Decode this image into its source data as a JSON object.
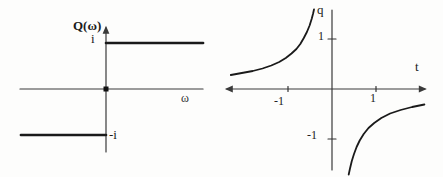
{
  "figure": {
    "background_color": "#fdfdfc",
    "line_color": "#1a1a1a",
    "axis_color": "#3a3a3a"
  },
  "chart_data": [
    {
      "id": "frequency-domain-step",
      "type": "line",
      "title": "",
      "xlabel": "ω",
      "ylabel": "Q(ω)",
      "xlim": [
        -1.87,
        2.11
      ],
      "ylim": [
        -1.37,
        1.33
      ],
      "grid": false,
      "legend": "none",
      "function": "Q(ω) = i for ω > 0, -i for ω < 0",
      "annotations": {
        "upper_level": "i",
        "lower_level": "-i"
      },
      "x_axis_arrows": "none",
      "y_axis_arrow": "top",
      "origin_marker": [
        0,
        0
      ],
      "x_ticks": [],
      "y_ticks": [],
      "series": [
        {
          "name": "upper-step",
          "points": [
            [
              0,
              1
            ],
            [
              2.11,
              1
            ]
          ]
        },
        {
          "name": "lower-step",
          "points": [
            [
              -1.85,
              -1
            ],
            [
              0,
              -1
            ]
          ]
        }
      ]
    },
    {
      "id": "time-domain-kernel",
      "type": "line",
      "title": "",
      "xlabel": "t",
      "ylabel": "q",
      "xlim": [
        -2.39,
        2.11
      ],
      "ylim": [
        -1.62,
        1.58
      ],
      "grid": false,
      "legend": "none",
      "function": "q(t) ∝ -1/t (hyperbola branches, vertical asymptote at t = 0)",
      "x_axis_arrows": "both",
      "y_axis_arrow": "none",
      "x_ticks": [
        {
          "value": -1,
          "label": "-1"
        },
        {
          "value": 1,
          "label": "1"
        }
      ],
      "y_ticks": [
        {
          "value": 1,
          "label": "1"
        },
        {
          "value": -1,
          "label": "-1"
        }
      ],
      "series": [
        {
          "name": "left-branch",
          "points": [
            [
              -2.3,
              0.28
            ],
            [
              -2.05,
              0.32
            ],
            [
              -1.8,
              0.36
            ],
            [
              -1.58,
              0.41
            ],
            [
              -1.38,
              0.47
            ],
            [
              -1.2,
              0.54
            ],
            [
              -1.05,
              0.62
            ],
            [
              -0.92,
              0.71
            ],
            [
              -0.81,
              0.8
            ],
            [
              -0.72,
              0.9
            ],
            [
              -0.64,
              1.02
            ],
            [
              -0.57,
              1.14
            ],
            [
              -0.51,
              1.27
            ],
            [
              -0.46,
              1.41
            ],
            [
              -0.43,
              1.51
            ],
            [
              -0.41,
              1.59
            ]
          ]
        },
        {
          "name": "right-branch",
          "points": [
            [
              0.38,
              -1.71
            ],
            [
              0.41,
              -1.59
            ],
            [
              0.45,
              -1.44
            ],
            [
              0.5,
              -1.3
            ],
            [
              0.56,
              -1.16
            ],
            [
              0.63,
              -1.03
            ],
            [
              0.72,
              -0.9
            ],
            [
              0.83,
              -0.78
            ],
            [
              0.96,
              -0.68
            ],
            [
              1.12,
              -0.58
            ],
            [
              1.32,
              -0.49
            ],
            [
              1.56,
              -0.42
            ],
            [
              1.82,
              -0.36
            ],
            [
              2.1,
              -0.31
            ]
          ]
        }
      ]
    }
  ]
}
